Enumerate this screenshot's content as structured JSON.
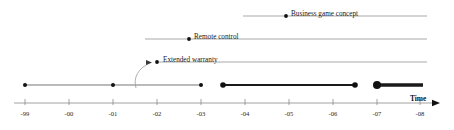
{
  "chart_data": {
    "type": "timeline",
    "title": "",
    "xlabel": "Time",
    "grid": false,
    "legend": null,
    "axis": {
      "label": "Time",
      "orientation": "horizontal",
      "arrow": true,
      "tick_labels": [
        "-99",
        "-00",
        "-01",
        "-02",
        "-03",
        "-04",
        "-05",
        "-06",
        "-07",
        "-08"
      ],
      "tick_x": [
        25,
        69,
        113,
        157,
        201,
        245,
        289,
        333,
        377,
        420
      ],
      "line_y": 103,
      "x_start": 14,
      "x_end": 432
    },
    "rows": [
      {
        "name": "business-game-concept",
        "label": "Business game concept",
        "y": 16,
        "line_x_start": 243,
        "line_x_end": 427,
        "line_weight": 0.6,
        "marker_x": 286,
        "marker_r": 1.9,
        "label_x": 291,
        "label_y": 11
      },
      {
        "name": "remote-control",
        "label": "Remote control",
        "y": 39,
        "line_x_start": 145,
        "line_x_end": 427,
        "line_weight": 0.6,
        "marker_x": 189,
        "marker_r": 1.9,
        "label_x": 194,
        "label_y": 34
      },
      {
        "name": "extended-warranty",
        "label": "Extended warranty",
        "y": 62,
        "line_x_start": 157,
        "line_x_end": 427,
        "line_weight": 0.6,
        "marker_x": 157,
        "marker_r": 1.9,
        "label_x": 163,
        "label_y": 57
      }
    ],
    "main_line": {
      "name": "main-timeline",
      "y": 85,
      "x_start": 25,
      "x_end": 423,
      "segments": [
        {
          "name": "thin-segment",
          "x1": 25,
          "x2": 201,
          "weight": 0.6
        },
        {
          "name": "medium-segment",
          "x1": 223,
          "x2": 355,
          "weight": 1.8
        },
        {
          "name": "thick-segment",
          "x1": 377,
          "x2": 423,
          "weight": 3.4
        }
      ],
      "markers": [
        {
          "name": "event-marker-1",
          "x": 25,
          "r": 2.0
        },
        {
          "name": "event-marker-2",
          "x": 113,
          "r": 2.0
        },
        {
          "name": "event-marker-3",
          "x": 201,
          "r": 2.0
        },
        {
          "name": "event-marker-4",
          "x": 223,
          "r": 2.8
        },
        {
          "name": "event-marker-5",
          "x": 355,
          "r": 2.8
        },
        {
          "name": "event-marker-6",
          "x": 377,
          "r": 4.0
        }
      ]
    },
    "callout_arrow": {
      "name": "extended-warranty-callout",
      "path": "M 136 88 C 133 78 138 68 150 63",
      "arrow_tip_x": 152,
      "arrow_tip_y": 62.5
    },
    "colors": {
      "line": "#6e6e6e",
      "main_line": "#1a1a1a",
      "axis": "#8a8a8a",
      "marker": "#111111",
      "text": "#1a1a1a"
    }
  }
}
